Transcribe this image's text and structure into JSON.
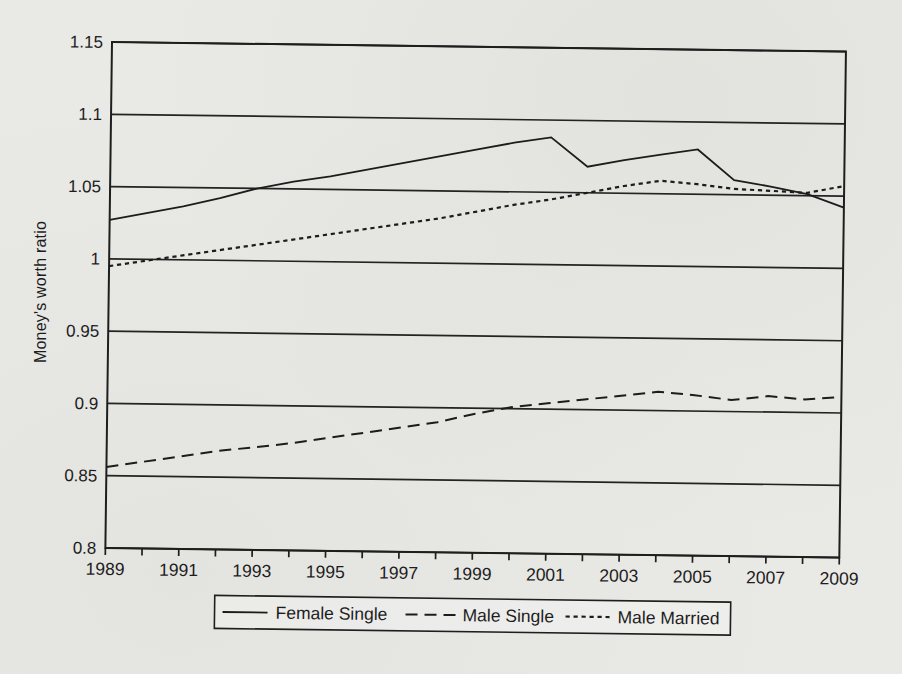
{
  "page": {
    "background": "#e9e9e6",
    "ink_color": "#1c1c1c"
  },
  "chart_data": {
    "type": "line",
    "title": "",
    "xlabel": "",
    "ylabel": "Money's worth ratio",
    "xlim": [
      1989,
      2009
    ],
    "ylim": [
      0.8,
      1.15
    ],
    "grid": "horizontal",
    "legend_position": "bottom",
    "x": [
      1989,
      1990,
      1991,
      1992,
      1993,
      1994,
      1995,
      1996,
      1997,
      1998,
      1999,
      2000,
      2001,
      2002,
      2003,
      2004,
      2005,
      2006,
      2007,
      2008,
      2009
    ],
    "x_tick_labels": [
      "1989",
      "1991",
      "1993",
      "1995",
      "1997",
      "1999",
      "2001",
      "2003",
      "2005",
      "2007",
      "2009"
    ],
    "y_ticks": [
      0.8,
      0.85,
      0.9,
      0.95,
      1,
      1.05,
      1.1,
      1.15
    ],
    "y_tick_labels": [
      "0.8",
      "0.85",
      "0.9",
      "0.95",
      "1",
      "1.05",
      "1.1",
      "1.15"
    ],
    "series": [
      {
        "name": "Female Single",
        "dash": "solid",
        "values": [
          1.027,
          1.032,
          1.037,
          1.043,
          1.05,
          1.055,
          1.059,
          1.064,
          1.069,
          1.074,
          1.079,
          1.084,
          1.088,
          1.068,
          1.073,
          1.077,
          1.081,
          1.06,
          1.056,
          1.051,
          1.042
        ]
      },
      {
        "name": "Male Single",
        "dash": "long-dash",
        "values": [
          0.856,
          0.86,
          0.864,
          0.868,
          0.871,
          0.874,
          0.878,
          0.882,
          0.886,
          0.89,
          0.896,
          0.901,
          0.904,
          0.907,
          0.91,
          0.913,
          0.911,
          0.908,
          0.911,
          0.909,
          0.911
        ]
      },
      {
        "name": "Male Married",
        "dash": "short-dash",
        "values": [
          0.995,
          0.999,
          1.003,
          1.007,
          1.011,
          1.015,
          1.019,
          1.023,
          1.027,
          1.031,
          1.036,
          1.041,
          1.045,
          1.05,
          1.055,
          1.059,
          1.057,
          1.054,
          1.053,
          1.052,
          1.057
        ]
      }
    ]
  }
}
